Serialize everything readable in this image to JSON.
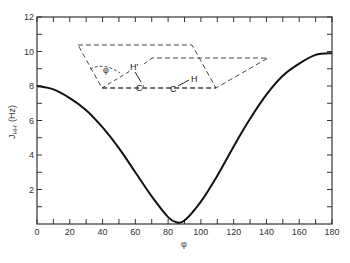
{
  "chart_data": {
    "type": "line",
    "title": "",
    "xlabel": "φ",
    "ylabel": "J_HH' (Hz)",
    "ylabel_main": "J",
    "ylabel_sub": "HH'",
    "ylabel_unit": " (Hz)",
    "xlim": [
      0,
      180
    ],
    "ylim": [
      0,
      12
    ],
    "grid": false,
    "legend": null,
    "x_ticks_major": [
      0,
      20,
      40,
      60,
      80,
      100,
      120,
      140,
      160,
      180
    ],
    "x_ticks_minor": [
      10,
      30,
      50,
      70,
      90,
      110,
      130,
      150,
      170
    ],
    "y_ticks_labeled": [
      2,
      4,
      6,
      8,
      10,
      12
    ],
    "y_ticks_minor": [
      1,
      3,
      5,
      7,
      9,
      11
    ],
    "origin_label": "0",
    "series": [
      {
        "name": "Karplus curve J_HH' vs φ",
        "x": [
          0,
          10,
          20,
          30,
          40,
          50,
          60,
          70,
          80,
          85,
          90,
          100,
          110,
          120,
          130,
          140,
          150,
          160,
          170,
          180
        ],
        "y": [
          8.0,
          7.8,
          7.3,
          6.6,
          5.6,
          4.4,
          3.0,
          1.6,
          0.4,
          0.1,
          0.2,
          1.3,
          2.8,
          4.5,
          6.1,
          7.5,
          8.6,
          9.3,
          9.8,
          9.9
        ]
      }
    ],
    "annotations": {
      "inset_diagram": {
        "description": "Dihedral angle φ between H'-C'-C and C'-C-H planes (dashed parallelograms)",
        "labels": [
          "H'",
          "C'",
          "C",
          "H",
          "φ"
        ]
      }
    }
  },
  "labels": {
    "x_axis": "φ",
    "inset": {
      "h_prime": "H'",
      "c_prime": "C'",
      "c": "C",
      "h": "H",
      "phi": "φ"
    }
  }
}
